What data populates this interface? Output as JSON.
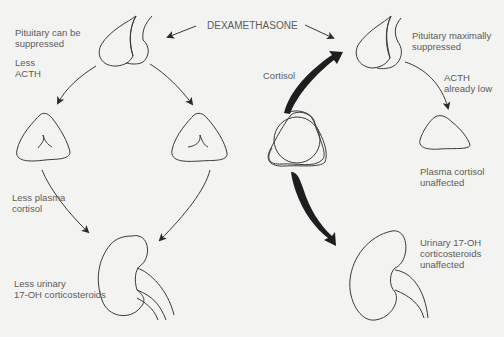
{
  "title": "DEXAMETHASONE",
  "left_pathway": {
    "pituitary_label": "Pituitary can be\nsuppressed",
    "acth_label": "Less\nACTH",
    "cortisol_label": "Less plasma\ncortisol",
    "urinary_label": "Less urinary\n17-OH corticosteroids"
  },
  "right_pathway": {
    "pituitary_label": "Pituitary maximally\nsuppressed",
    "acth_label": "ACTH\nalready low",
    "cortisol_feedback_label": "Cortisol",
    "plasma_label": "Plasma cortisol\nunaffected",
    "urinary_label": "Urinary 17-OH\ncorticosteroids\nunaffected"
  },
  "colors": {
    "background": "#f3f3f1",
    "line": "#3a3a3a",
    "text": "#5c5c5c",
    "thick_arrow": "#1e1e1e"
  }
}
